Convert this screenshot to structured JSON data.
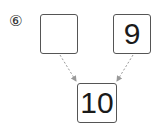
{
  "problem": {
    "number_label": "⑥",
    "left_box": {
      "value": ""
    },
    "right_box": {
      "value": "9"
    },
    "result_box": {
      "value": "10"
    }
  },
  "colors": {
    "box_border": "#555555",
    "arrow": "#999999"
  }
}
